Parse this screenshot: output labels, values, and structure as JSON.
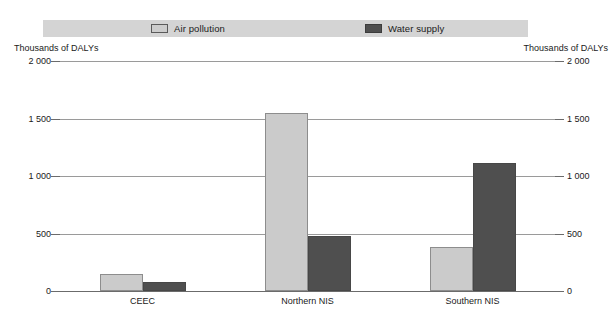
{
  "chart_data": {
    "type": "bar",
    "title": "",
    "subtitle": "",
    "xlabel": "",
    "ylabel": "Thousands of DALYs",
    "ylabel_right": "Thousands of DALYs",
    "categories": [
      "CEEC",
      "Northern NIS",
      "Southern NIS"
    ],
    "series": [
      {
        "name": "Air pollution",
        "color": "#cbcbcb",
        "values": [
          150,
          1550,
          380
        ]
      },
      {
        "name": "Water supply",
        "color": "#4f4f4f",
        "values": [
          80,
          480,
          1110
        ]
      }
    ],
    "ylim": [
      0,
      2000
    ],
    "ytick_values": [
      2000,
      1500,
      1000,
      500,
      0
    ],
    "ytick_labels": [
      "2 000",
      "1 500",
      "1 000",
      "500",
      "0"
    ],
    "ytick_labels_right": [
      "2 000",
      "1 500",
      "1 000",
      "500",
      "0"
    ],
    "grid": true,
    "legend_position": "top",
    "legend": [
      "Air pollution",
      "Water supply"
    ]
  },
  "legend": {
    "background_color": "#d4d4d4",
    "entries": [
      {
        "label": "Air pollution",
        "swatch": "light"
      },
      {
        "label": "Water supply",
        "swatch": "dark"
      }
    ]
  },
  "axis": {
    "left_caption": "Thousands of DALYs",
    "right_caption": "Thousands of DALYs"
  }
}
